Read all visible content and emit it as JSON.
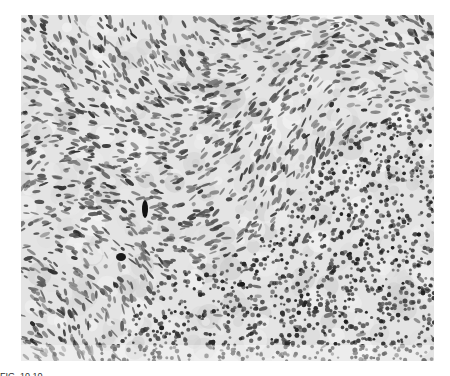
{
  "figure": {
    "type": "histology-micrograph",
    "stain": "grayscale",
    "regions": [
      {
        "name": "spindle-cell-stroma",
        "area": "upper-left and center"
      },
      {
        "name": "dense-lymphocyte-infiltrate",
        "area": "lower-right"
      }
    ],
    "caption_partial": "FIG. 10.10"
  }
}
